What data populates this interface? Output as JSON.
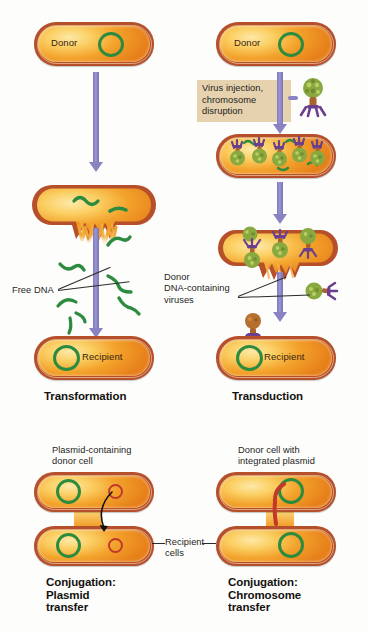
{
  "figure": {
    "background_color": "#fdfdfb"
  },
  "colors": {
    "cell_wall": "#b5502a",
    "cytoplasm_light": "#fde9a8",
    "cytoplasm_dark": "#e7801a",
    "chromosome_green": "#2d8b3f",
    "plasmid_red": "#c0392b",
    "arrow_purple": "#8983c4",
    "callout_tan": "#e6d2ae",
    "phage_head_green": "#8aa840",
    "phage_tail_brown": "#a9632c",
    "phage_fiber_purple": "#6b3f8f",
    "text_dark": "#1a1a1a"
  },
  "panels": {
    "transformation": {
      "caption": "Transformation",
      "donor_cell_label": "Donor",
      "recipient_cell_label": "Recipient",
      "free_dna_label": "Free DNA",
      "free_dna_fragment_count": 7,
      "lysing_cell_dna_fragment_count": 2,
      "arrow_icon": "down-arrow-icon"
    },
    "transduction": {
      "caption": "Transduction",
      "donor_cell_label": "Donor",
      "recipient_cell_label": "Recipient",
      "process_callout": "Virus injection,\nchromosome\ndisruption",
      "viruses_label": "Donor\nDNA-containing\nviruses",
      "viruses_inside_cell_count": 5,
      "released_virus_count": 3,
      "injecting_virus_count": 1,
      "arrow_icon": "down-arrow-icon"
    },
    "conjugation_plasmid": {
      "caption": "Conjugation:\nPlasmid\ntransfer",
      "donor_label": "Plasmid-containing\ndonor cell",
      "transfer_arrow_icon": "curved-transfer-arrow-icon",
      "donor_chromosome": "green-ring",
      "donor_plasmid": "red-ring",
      "recipient_chromosome": "green-ring",
      "recipient_plasmid": "red-ring"
    },
    "conjugation_chromosome": {
      "caption": "Conjugation:\nChromosome\ntransfer",
      "donor_label": "Donor cell with\nintegrated plasmid",
      "integrated_plasmid": "red-strand",
      "donor_chromosome": "green-ring",
      "recipient_chromosome": "green-ring"
    },
    "shared": {
      "recipient_cells_label": "Recipient\ncells"
    }
  }
}
